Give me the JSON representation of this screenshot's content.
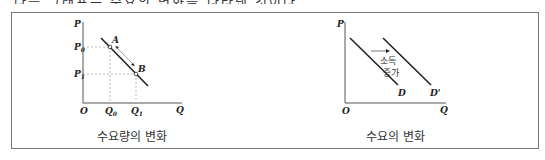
{
  "clipped_header_text": "다음 그래프는 수요의 변화를 나타낸 것이다.",
  "left_panel": {
    "caption": "수요량의 변화",
    "axis_y": "P",
    "axis_x": "Q",
    "origin": "O",
    "p0": "P0",
    "p1": "P1",
    "q0": "Q0",
    "q1": "Q1",
    "point_a": "A",
    "point_b": "B"
  },
  "right_panel": {
    "caption": "수요의 변화",
    "axis_y": "P",
    "axis_x": "Q",
    "origin": "O",
    "curve_d": "D",
    "curve_d_prime": "D'",
    "shift_label_1": "소득",
    "shift_label_2": "증가"
  }
}
